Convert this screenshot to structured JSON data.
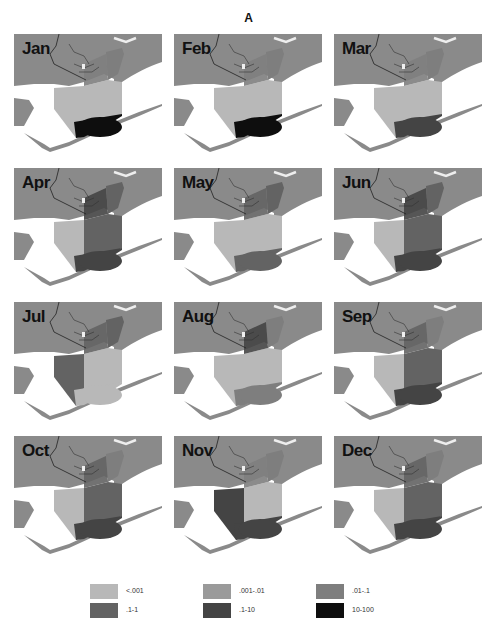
{
  "figure": {
    "label": "A"
  },
  "chart_data": {
    "type": "heatmap",
    "title": "A",
    "panels": [
      {
        "month": "Jan",
        "upper_bay": ".01-.1",
        "west_bay": "<.001",
        "central_bay": "<.001",
        "lower_bay": "10-100",
        "east_arm": ".01-.1"
      },
      {
        "month": "Feb",
        "upper_bay": ".01-.1",
        "west_bay": "<.001",
        "central_bay": "<.001",
        "lower_bay": "10-100",
        "east_arm": ".01-.1"
      },
      {
        "month": "Mar",
        "upper_bay": ".01-.1",
        "west_bay": "<.001",
        "central_bay": "<.001",
        "lower_bay": ".1-10",
        "east_arm": ".01-.1"
      },
      {
        "month": "Apr",
        "upper_bay": ".1-10",
        "west_bay": "<.001",
        "central_bay": ".1-1",
        "lower_bay": ".1-10",
        "east_arm": ".1-1"
      },
      {
        "month": "May",
        "upper_bay": ".1-1",
        "west_bay": "<.001",
        "central_bay": "<.001",
        "lower_bay": ".1-1",
        "east_arm": ".1-1"
      },
      {
        "month": "Jun",
        "upper_bay": ".1-10",
        "west_bay": "<.001",
        "central_bay": ".1-1",
        "lower_bay": ".1-10",
        "east_arm": ".1-1"
      },
      {
        "month": "Jul",
        "upper_bay": ".1-1",
        "west_bay": ".1-1",
        "central_bay": "<.001",
        "lower_bay": "<.001",
        "east_arm": ".1-1"
      },
      {
        "month": "Aug",
        "upper_bay": ".1-10",
        "west_bay": "<.001",
        "central_bay": "<.001",
        "lower_bay": ".01-.1",
        "east_arm": ".01-.1"
      },
      {
        "month": "Sep",
        "upper_bay": ".1-1",
        "west_bay": "<.001",
        "central_bay": ".1-1",
        "lower_bay": ".1-10",
        "east_arm": ".01-.1"
      },
      {
        "month": "Oct",
        "upper_bay": ".1-1",
        "west_bay": "<.001",
        "central_bay": ".1-1",
        "lower_bay": ".1-10",
        "east_arm": ".01-.1"
      },
      {
        "month": "Nov",
        "upper_bay": ".01-.1",
        "west_bay": ".1-10",
        "central_bay": "<.001",
        "lower_bay": ".1-10",
        "east_arm": ".01-.1"
      },
      {
        "month": "Dec",
        "upper_bay": ".1-1",
        "west_bay": "<.001",
        "central_bay": ".1-1",
        "lower_bay": ".1-10",
        "east_arm": ".01-.1"
      }
    ],
    "legend": [
      {
        "label": "<.001",
        "color": "#b8b8b8"
      },
      {
        "label": ".001-.01",
        "color": "#9a9a9a"
      },
      {
        "label": ".01-.1",
        "color": "#7e7e7e"
      },
      {
        "label": ".1-1",
        "color": "#636363"
      },
      {
        "label": ".1-10",
        "color": "#444444"
      },
      {
        "label": "10-100",
        "color": "#0e0e0e"
      }
    ],
    "land_color": "#8a8a8a",
    "water_color": "#f4f4f4"
  },
  "months": [
    "Jan",
    "Feb",
    "Mar",
    "Apr",
    "May",
    "Jun",
    "Jul",
    "Aug",
    "Sep",
    "Oct",
    "Nov",
    "Dec"
  ],
  "legend_labels": [
    "<.001",
    ".001-.01",
    ".01-.1",
    ".1-1",
    ".1-10",
    "10-100"
  ]
}
